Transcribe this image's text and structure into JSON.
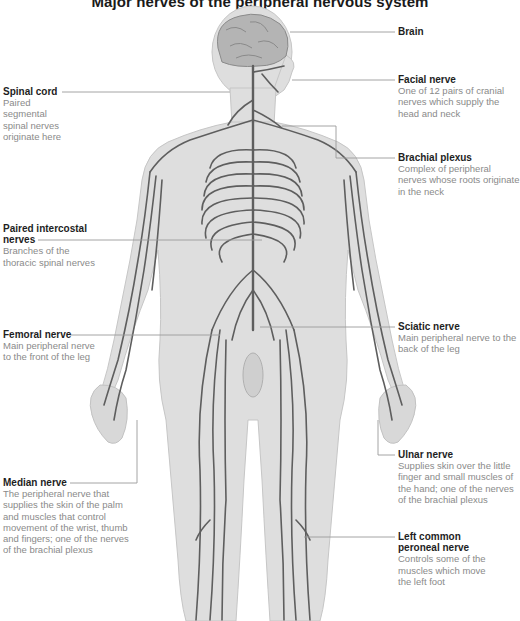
{
  "title": "Major nerves of the peripheral nervous system",
  "colors": {
    "body_fill": "#dcdcdc",
    "body_outline": "#c4c4c4",
    "nerve": "#5e5e5e",
    "leader_line": "#9a9a9a",
    "label_heading": "#1e1e1e",
    "label_text": "#8a8a8a"
  },
  "labels": {
    "brain": {
      "heading": "Brain",
      "description": ""
    },
    "facial_nerve": {
      "heading": "Facial nerve",
      "description": "One of 12 pairs of cranial nerves which supply the head and neck"
    },
    "brachial_plexus": {
      "heading": "Brachial plexus",
      "description": "Complex of peripheral nerves whose roots originate in the neck"
    },
    "spinal_cord": {
      "heading": "Spinal cord",
      "description": "Paired segmental spinal nerves originate here"
    },
    "paired_intercostal": {
      "heading": "Paired intercostal nerves",
      "description": "Branches of the thoracic spinal nerves"
    },
    "femoral_nerve": {
      "heading": "Femoral nerve",
      "description": "Main peripheral nerve to the front of the leg"
    },
    "sciatic_nerve": {
      "heading": "Sciatic nerve",
      "description": "Main peripheral nerve to the back of the leg"
    },
    "ulnar_nerve": {
      "heading": "Ulnar nerve",
      "description": "Supplies skin over the little finger and small muscles of the hand; one of the nerves of the brachial plexus"
    },
    "median_nerve": {
      "heading": "Median nerve",
      "description": "The peripheral nerve that supplies the skin of the palm and muscles that control movement of the wrist, thumb and fingers; one of the nerves of the brachial plexus"
    },
    "left_common_peroneal": {
      "heading": "Left common peroneal nerve",
      "description": "Controls some of the muscles which move the left foot"
    }
  }
}
